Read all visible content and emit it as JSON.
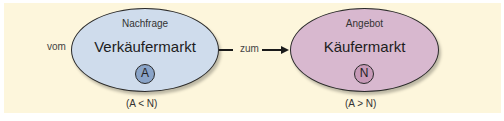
{
  "diagram": {
    "left_label": "vom",
    "connector_label": "zum",
    "nodes": [
      {
        "top_label": "Nachfrage",
        "title": "Verkäufermarkt",
        "badge": "A",
        "condition": "(A < N)",
        "fill": "#cfdcec"
      },
      {
        "top_label": "Angebot",
        "title": "Käufermarkt",
        "badge": "N",
        "condition": "(A > N)",
        "fill": "#d8b8cf"
      }
    ],
    "background": "#fdf6dc"
  }
}
